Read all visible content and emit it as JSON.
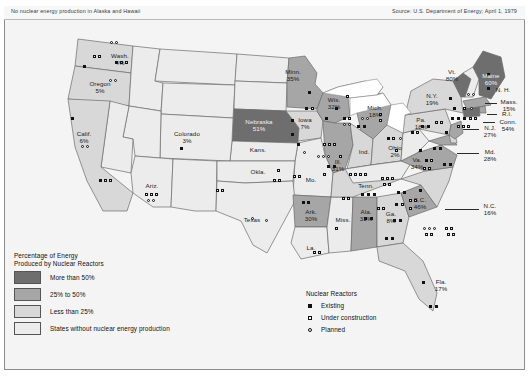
{
  "header": {
    "note": "No nuclear energy production in Alaska and Hawaii",
    "source": "Source: U.S. Department of Energy; April 1, 1979"
  },
  "legend": {
    "title_line1": "Percentage of Energy",
    "title_line2": "Produced by Nuclear Reactors",
    "classes": [
      {
        "label": "More than 50%",
        "color": "#6e6e6e"
      },
      {
        "label": "25% to 50%",
        "color": "#a6a6a6"
      },
      {
        "label": "Less than 25%",
        "color": "#d8d8d8"
      },
      {
        "label": "States without nuclear energy production",
        "color": "#ececec"
      }
    ]
  },
  "reactor_legend": {
    "title": "Nuclear Reactors",
    "items": [
      {
        "symbol": "filled-square",
        "label": "Existing"
      },
      {
        "symbol": "open-square",
        "label": "Under construction"
      },
      {
        "symbol": "open-circle",
        "label": "Planned"
      }
    ]
  },
  "states": [
    {
      "name": "Wash.",
      "pct": "4%"
    },
    {
      "name": "Oregon",
      "pct": "5%"
    },
    {
      "name": "Calif.",
      "pct": "6%"
    },
    {
      "name": "Ariz.",
      "pct": ""
    },
    {
      "name": "Colorado",
      "pct": "3%"
    },
    {
      "name": "Nebraska",
      "pct": "51%"
    },
    {
      "name": "Kans.",
      "pct": ""
    },
    {
      "name": "Minn.",
      "pct": "35%"
    },
    {
      "name": "Iowa",
      "pct": "7%"
    },
    {
      "name": "Wis.",
      "pct": "32%"
    },
    {
      "name": "Ill.",
      "pct": "31%"
    },
    {
      "name": "Mich.",
      "pct": "18%"
    },
    {
      "name": "Ind.",
      "pct": ""
    },
    {
      "name": "Ohio",
      "pct": "2%"
    },
    {
      "name": "Mo.",
      "pct": ""
    },
    {
      "name": "Okla.",
      "pct": ""
    },
    {
      "name": "Texas",
      "pct": ""
    },
    {
      "name": "Ark.",
      "pct": "30%"
    },
    {
      "name": "La.",
      "pct": ""
    },
    {
      "name": "Miss.",
      "pct": ""
    },
    {
      "name": "Ala.",
      "pct": "33%"
    },
    {
      "name": "Tenn.",
      "pct": ""
    },
    {
      "name": "Ga.",
      "pct": "8%"
    },
    {
      "name": "Fla.",
      "pct": "17%"
    },
    {
      "name": "S.C.",
      "pct": "46%"
    },
    {
      "name": "N.C.",
      "pct": "16%"
    },
    {
      "name": "Va.",
      "pct": "34%"
    },
    {
      "name": "Md.",
      "pct": "28%"
    },
    {
      "name": "N.J.",
      "pct": "27%"
    },
    {
      "name": "Pa.",
      "pct": "18%"
    },
    {
      "name": "N.Y.",
      "pct": "19%"
    },
    {
      "name": "Vt.",
      "pct": "80%"
    },
    {
      "name": "Maine",
      "pct": "60%"
    },
    {
      "name": "N. H.",
      "pct": ""
    },
    {
      "name": "Mass.",
      "pct": "15%"
    },
    {
      "name": "R.I.",
      "pct": ""
    },
    {
      "name": "Conn.",
      "pct": "54%"
    }
  ],
  "labels": {
    "wash": "Wash.",
    "wash_pct": "4%",
    "oregon": "Oregon",
    "oregon_pct": "5%",
    "calif": "Calif.",
    "calif_pct": "6%",
    "ariz": "Ariz.",
    "colorado": "Colorado",
    "colorado_pct": "3%",
    "nebraska": "Nebraska",
    "nebraska_pct": "51%",
    "kans": "Kans.",
    "minn": "Minn.",
    "minn_pct": "35%",
    "iowa": "Iowa",
    "iowa_pct": "7%",
    "wis": "Wis.",
    "wis_pct": "32%",
    "ill": "Ill.",
    "ill_pct": "31%",
    "mich": "Mich.",
    "mich_pct": "18%",
    "ind": "Ind.",
    "ohio": "Ohio",
    "ohio_pct": "2%",
    "mo": "Mo.",
    "okla": "Okla.",
    "texas": "Texas",
    "ark": "Ark.",
    "ark_pct": "30%",
    "la": "La.",
    "miss": "Miss.",
    "ala": "Ala.",
    "ala_pct": "33%",
    "tenn": "Tenn.",
    "ga": "Ga.",
    "ga_pct": "8%",
    "fla": "Fla.",
    "fla_pct": "17%",
    "sc": "S.C.",
    "sc_pct": "46%",
    "nc": "N.C.",
    "nc_pct": "16%",
    "va": "Va.",
    "va_pct": "34%",
    "md": "Md.",
    "md_pct": "28%",
    "nj": "N.J.",
    "nj_pct": "27%",
    "pa": "Pa.",
    "pa_pct": "18%",
    "ny": "N.Y.",
    "ny_pct": "19%",
    "vt": "Vt.",
    "vt_pct": "80%",
    "maine": "Maine",
    "maine_pct": "60%",
    "nh": "N. H.",
    "mass": "Mass.",
    "mass_pct": "15%",
    "ri": "R.I.",
    "conn": "Conn.",
    "conn_pct": "54%"
  }
}
